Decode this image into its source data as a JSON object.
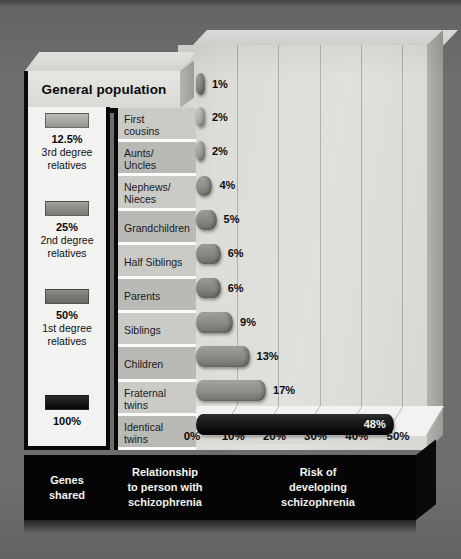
{
  "figure": {
    "background_color": "#6e6e6e",
    "panel_color": "#dcdcd8"
  },
  "header": {
    "general_population_label": "General population"
  },
  "legend": {
    "title": "Genes shared",
    "items": [
      {
        "percent": "12.5%",
        "description": "3rd degree\nrelatives",
        "color": "#a9a9a5"
      },
      {
        "percent": "25%",
        "description": "2nd degree\nrelatives",
        "color": "#8e8e8a"
      },
      {
        "percent": "50%",
        "description": "1st degree\nrelatives",
        "color": "#7b7b77"
      },
      {
        "percent": "100%",
        "description": "",
        "color": "#1b1b1b"
      }
    ]
  },
  "footer": {
    "columns": [
      "Genes\nshared",
      "Relationship\nto person with\nschizophrenia",
      "Risk of\ndeveloping\nschizophrenia"
    ]
  },
  "axis": {
    "ticks": [
      "0%",
      "10%",
      "20%",
      "30%",
      "40%",
      "50%"
    ],
    "min": 0,
    "max": 50
  },
  "chart_data": {
    "type": "bar",
    "orientation": "horizontal",
    "title": "Risk of developing schizophrenia",
    "xlabel": "Risk of developing schizophrenia",
    "ylabel": "Relationship to person with schizophrenia",
    "xlim": [
      0,
      50
    ],
    "xtick_labels": [
      "0%",
      "10%",
      "20%",
      "30%",
      "40%",
      "50%"
    ],
    "grid": true,
    "legend_position": "left",
    "units": "percent",
    "categories": [
      "General population",
      "First cousins",
      "Aunts/Uncles",
      "Nephews/Nieces",
      "Grandchildren",
      "Half Siblings",
      "Parents",
      "Siblings",
      "Children",
      "Fraternal twins",
      "Identical twins"
    ],
    "values": [
      1,
      2,
      2,
      4,
      5,
      6,
      6,
      9,
      13,
      17,
      48
    ],
    "value_labels": [
      "1%",
      "2%",
      "2%",
      "4%",
      "5%",
      "6%",
      "6%",
      "9%",
      "13%",
      "17%",
      "48%"
    ],
    "genes_shared": [
      "",
      "12.5%",
      "12.5%",
      "12.5%",
      "25%",
      "25%",
      "50%",
      "50%",
      "50%",
      "50%",
      "100%"
    ]
  },
  "rows": [
    {
      "label": "First\ncousins",
      "value_label": "2%",
      "value": 2,
      "shade": "#cacac6",
      "bar_color": "#b4b4b0",
      "label_inside": false
    },
    {
      "label": "Aunts/\nUncles",
      "value_label": "2%",
      "value": 2,
      "shade": "#b9b9b5",
      "bar_color": "#a6a6a2",
      "label_inside": false
    },
    {
      "label": "Nephews/\nNieces",
      "value_label": "4%",
      "value": 4,
      "shade": "#cacac6",
      "bar_color": "#8d8d89",
      "label_inside": false
    },
    {
      "label": "Grandchildren",
      "value_label": "5%",
      "value": 5,
      "shade": "#b9b9b5",
      "bar_color": "#868682",
      "label_inside": false
    },
    {
      "label": "Half Siblings",
      "value_label": "6%",
      "value": 6,
      "shade": "#cacac6",
      "bar_color": "#86867f",
      "label_inside": false
    },
    {
      "label": "Parents",
      "value_label": "6%",
      "value": 6,
      "shade": "#b9b9b5",
      "bar_color": "#84847e",
      "label_inside": false
    },
    {
      "label": "Siblings",
      "value_label": "9%",
      "value": 9,
      "shade": "#cacac6",
      "bar_color": "#8a8a84",
      "label_inside": false
    },
    {
      "label": "Children",
      "value_label": "13%",
      "value": 13,
      "shade": "#b9b9b5",
      "bar_color": "#8a8a84",
      "label_inside": false
    },
    {
      "label": "Fraternal\ntwins",
      "value_label": "17%",
      "value": 17,
      "shade": "#cacac6",
      "bar_color": "#8e8e88",
      "label_inside": false
    },
    {
      "label": "Identical\ntwins",
      "value_label": "48%",
      "value": 48,
      "shade": "#b9b9b5",
      "bar_color": "#151515",
      "label_inside": true
    }
  ],
  "general_population_bar": {
    "value_label": "1%",
    "value": 1,
    "bar_color": "#8b8b87"
  }
}
